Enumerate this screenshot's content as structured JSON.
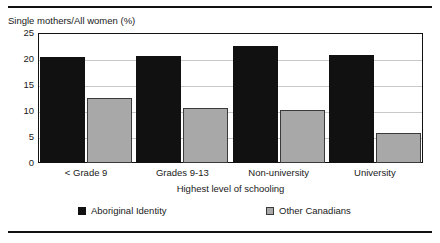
{
  "chart_data": {
    "type": "bar",
    "title": "",
    "ylabel": "Single mothers/All women (%)",
    "xlabel": "Highest level of schooling",
    "categories": [
      "< Grade 9",
      "Grades 9-13",
      "Non-university",
      "University"
    ],
    "series": [
      {
        "name": "Aboriginal Identity",
        "color": "#111111",
        "values": [
          20.3,
          20.6,
          22.5,
          20.7
        ]
      },
      {
        "name": "Other Canadians",
        "color": "#a8a8a8",
        "values": [
          12.5,
          10.6,
          10.1,
          5.7
        ]
      }
    ],
    "ylim": [
      0,
      25
    ],
    "yticks": [
      0,
      5,
      10,
      15,
      20,
      25
    ],
    "grid": true,
    "legend_position": "bottom"
  },
  "legend": {
    "entries": [
      {
        "label": "Aboriginal Identity"
      },
      {
        "label": "Other Canadians"
      }
    ]
  }
}
